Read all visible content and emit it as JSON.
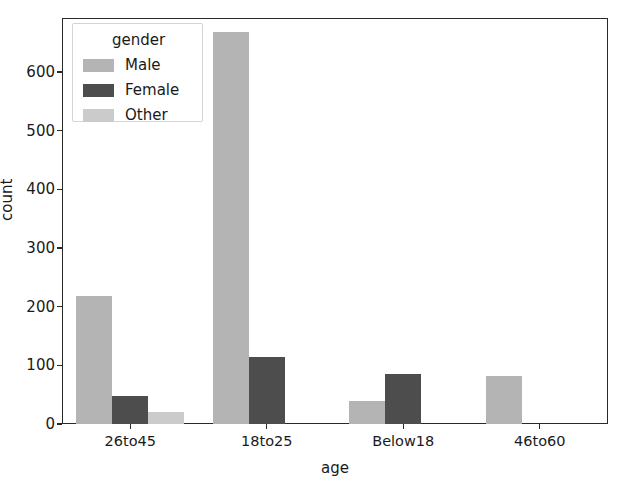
{
  "chart_data": {
    "type": "bar",
    "title": "",
    "xlabel": "age",
    "ylabel": "count",
    "categories": [
      "26to45",
      "18to25",
      "Below18",
      "46to60"
    ],
    "series": [
      {
        "name": "Male",
        "values": [
          218,
          668,
          39,
          82
        ],
        "color": "#b4b4b4"
      },
      {
        "name": "Female",
        "values": [
          48,
          114,
          85,
          0
        ],
        "color": "#4d4d4d"
      },
      {
        "name": "Other",
        "values": [
          20,
          0,
          0,
          0
        ],
        "color": "#cbcbcb"
      }
    ],
    "legend_title": "gender",
    "legend_position": "upper left",
    "ylim": [
      0,
      700
    ],
    "yticks": [
      0,
      100,
      200,
      300,
      400,
      500,
      600
    ],
    "ytick_labels": [
      "0",
      "100",
      "200",
      "300",
      "400",
      "500",
      "600"
    ],
    "grid": false,
    "background": "#ffffff",
    "axis_color": "#2a2a2a"
  }
}
